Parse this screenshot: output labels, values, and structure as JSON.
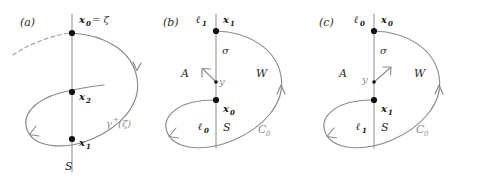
{
  "figure": {
    "background": "#ffffff",
    "curve_color": "#8a8a8a",
    "node_color": "#111111",
    "label_color": "#2b2b2b",
    "grey_label_color": "#8d8d8d"
  },
  "panels": [
    {
      "id": "a",
      "tag": "(a)",
      "labels": {
        "top_point": "x",
        "top_point_sub": "0",
        "top_point_eq": "= ζ",
        "mid_point": "x",
        "mid_point_sub": "2",
        "low_point": "x",
        "low_point_sub": "1",
        "section": "S",
        "orbit": "γ",
        "orbit_sup": "+",
        "orbit_arg": "(ζ)"
      }
    },
    {
      "id": "b",
      "tag": "(b)",
      "labels": {
        "top_left": "ℓ",
        "top_left_sub": "1",
        "top_right": "x",
        "top_right_sub": "1",
        "sigma": "σ",
        "region_left": "A",
        "vector": "y",
        "region_right": "W",
        "mid_right": "x",
        "mid_right_sub": "0",
        "bottom_left": "ℓ",
        "bottom_left_sub": "0",
        "section": "S",
        "curve": "C",
        "curve_sub": "0"
      }
    },
    {
      "id": "c",
      "tag": "(c)",
      "labels": {
        "top_left": "ℓ",
        "top_left_sub": "0",
        "top_right": "x",
        "top_right_sub": "0",
        "sigma": "σ",
        "region_left": "A",
        "vector": "y",
        "region_right": "W",
        "mid_right": "x",
        "mid_right_sub": "1",
        "bottom_left": "ℓ",
        "bottom_left_sub": "1",
        "section": "S",
        "curve": "C",
        "curve_sub": "0"
      }
    }
  ]
}
